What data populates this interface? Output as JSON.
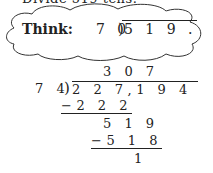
{
  "header": {
    "text": "Divide 519 tens."
  },
  "think": {
    "label": "Think:",
    "divisor": "7 0",
    "dividend": "5 1 9 ."
  },
  "division": {
    "quotient": "3 0 7",
    "divisor": "7 4",
    "dividend": "2 2 7,1 9 4",
    "step1": "−2 2 2",
    "step2": "5 1 9",
    "step3": "−5 1 8",
    "remainder": "1"
  }
}
